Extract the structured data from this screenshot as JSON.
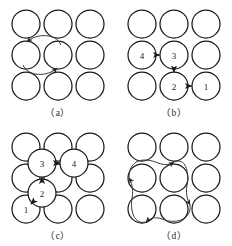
{
  "figure": {
    "background_color": "#ffffff",
    "node_stroke_color": "#1a1a1a",
    "arrow_color": "#3a3a3a",
    "grid": {
      "rows": 3,
      "cols": 3,
      "node_radius": 14
    }
  },
  "panels": [
    {
      "id": "a",
      "caption": "（a）",
      "description": "3x3 grid of empty circles with a two-way elliptical loop between the middle-left and center circles",
      "nodes": [
        {
          "row": 0,
          "col": 0,
          "label": ""
        },
        {
          "row": 0,
          "col": 1,
          "label": ""
        },
        {
          "row": 0,
          "col": 2,
          "label": ""
        },
        {
          "row": 1,
          "col": 0,
          "label": ""
        },
        {
          "row": 1,
          "col": 1,
          "label": ""
        },
        {
          "row": 1,
          "col": 2,
          "label": ""
        },
        {
          "row": 2,
          "col": 0,
          "label": ""
        },
        {
          "row": 2,
          "col": 1,
          "label": ""
        },
        {
          "row": 2,
          "col": 2,
          "label": ""
        }
      ],
      "arrows": [
        {
          "type": "arc",
          "from": "center",
          "to": "middle-left",
          "side": "top"
        },
        {
          "type": "arc",
          "from": "middle-left",
          "to": "center",
          "side": "bottom"
        }
      ]
    },
    {
      "id": "b",
      "caption": "（b）",
      "description": "3x3 grid with numbered circles 4, 3, 2, 1 connected by straight arrows forming a path",
      "nodes": [
        {
          "row": 0,
          "col": 0,
          "label": ""
        },
        {
          "row": 0,
          "col": 1,
          "label": ""
        },
        {
          "row": 0,
          "col": 2,
          "label": ""
        },
        {
          "row": 1,
          "col": 0,
          "label": "4"
        },
        {
          "row": 1,
          "col": 1,
          "label": "3"
        },
        {
          "row": 1,
          "col": 2,
          "label": ""
        },
        {
          "row": 2,
          "col": 0,
          "label": ""
        },
        {
          "row": 2,
          "col": 1,
          "label": "2"
        },
        {
          "row": 2,
          "col": 2,
          "label": "1"
        }
      ],
      "arrows": [
        {
          "type": "straight",
          "from": "4",
          "to": "3",
          "direction": "right"
        },
        {
          "type": "straight",
          "from": "3",
          "to": "2",
          "direction": "down"
        },
        {
          "type": "straight",
          "from": "2",
          "to": "1",
          "direction": "right"
        }
      ]
    },
    {
      "id": "c",
      "caption": "（c）",
      "description": "3x3 grid of circles overlaid with offset numbered circles 1, 2, 3, 4 in a diagonal staircase joined by short arrows",
      "nodes": [
        {
          "row": 0,
          "col": 0,
          "label": ""
        },
        {
          "row": 0,
          "col": 1,
          "label": ""
        },
        {
          "row": 0,
          "col": 2,
          "label": ""
        },
        {
          "row": 1,
          "col": 0,
          "label": ""
        },
        {
          "row": 1,
          "col": 1,
          "label": ""
        },
        {
          "row": 1,
          "col": 2,
          "label": ""
        },
        {
          "row": 2,
          "col": 0,
          "label": "1"
        },
        {
          "row": 2,
          "col": 1,
          "label": ""
        },
        {
          "row": 2,
          "col": 2,
          "label": ""
        }
      ],
      "offset_nodes": [
        {
          "label": "2",
          "x": 42,
          "y": 73
        },
        {
          "label": "3",
          "x": 42,
          "y": 45
        },
        {
          "label": "4",
          "x": 72,
          "y": 45
        }
      ],
      "arrows": [
        {
          "type": "straight",
          "from": "1",
          "to": "2",
          "direction": "up-right"
        },
        {
          "type": "straight",
          "from": "2",
          "to": "3",
          "direction": "up"
        },
        {
          "type": "straight",
          "from": "3",
          "to": "4",
          "direction": "right"
        }
      ]
    },
    {
      "id": "d",
      "caption": "（d）",
      "description": "3x3 grid of empty circles with a large clockwise four-lobed loop encircling the upper-left 2x2 block of circles",
      "nodes": [
        {
          "row": 0,
          "col": 0,
          "label": ""
        },
        {
          "row": 0,
          "col": 1,
          "label": ""
        },
        {
          "row": 0,
          "col": 2,
          "label": ""
        },
        {
          "row": 1,
          "col": 0,
          "label": ""
        },
        {
          "row": 1,
          "col": 1,
          "label": ""
        },
        {
          "row": 1,
          "col": 2,
          "label": ""
        },
        {
          "row": 2,
          "col": 0,
          "label": ""
        },
        {
          "row": 2,
          "col": 1,
          "label": ""
        },
        {
          "row": 2,
          "col": 2,
          "label": ""
        }
      ],
      "arrows": [
        {
          "type": "loop",
          "direction": "clockwise",
          "arrowheads": 4,
          "at": [
            "top",
            "right",
            "bottom",
            "left"
          ]
        }
      ]
    }
  ]
}
